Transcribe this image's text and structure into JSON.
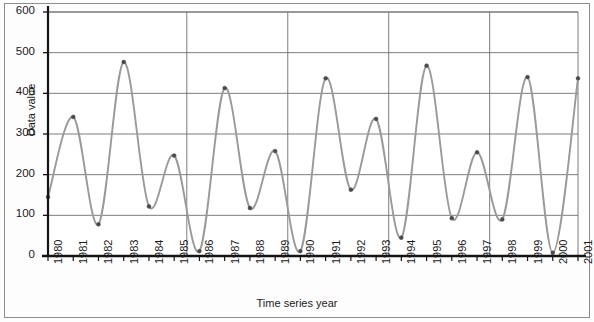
{
  "figure": {
    "ylabel_text": "Data value",
    "xlabel_text": "Time series year"
  },
  "chart_data": {
    "type": "line",
    "title": "",
    "subtitle": "",
    "xlabel": "Time series year",
    "ylabel": "Data value",
    "xlim": [
      1980,
      2001
    ],
    "ylim": [
      0,
      600
    ],
    "grid": true,
    "legend": "none",
    "markers": true,
    "line_color": "#9a9a9a",
    "marker_color": "#4a4a4a",
    "grid_color": "#6e6e6e",
    "axis_color": "#141414",
    "ytick_values": [
      0,
      100,
      200,
      300,
      400,
      500,
      600
    ],
    "ytick_labels": [
      "0",
      "100",
      "200",
      "300",
      "400",
      "500",
      "600"
    ],
    "categories": [
      "1980",
      "1981",
      "1982",
      "1983",
      "1984",
      "1985",
      "1986",
      "1987",
      "1988",
      "1989",
      "1990",
      "1991",
      "1992",
      "1993",
      "1994",
      "1995",
      "1996",
      "1997",
      "1998",
      "1999",
      "2000",
      "2001"
    ],
    "x": [
      1980,
      1981,
      1982,
      1983,
      1984,
      1985,
      1986,
      1987,
      1988,
      1989,
      1990,
      1991,
      1992,
      1993,
      1994,
      1995,
      1996,
      1997,
      1998,
      1999,
      2000,
      2001
    ],
    "values": [
      145,
      342,
      78,
      477,
      122,
      247,
      12,
      413,
      118,
      258,
      12,
      437,
      163,
      337,
      45,
      468,
      93,
      255,
      90,
      440,
      8,
      437
    ],
    "segment_dividers": [
      1985.5,
      1989.5,
      1993.5,
      1997.5
    ]
  }
}
